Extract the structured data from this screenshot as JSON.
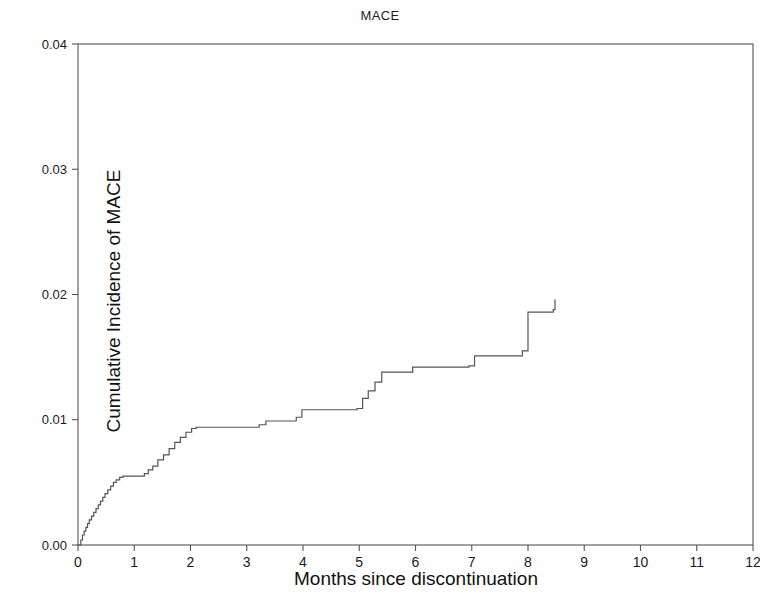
{
  "chart_data": {
    "type": "line",
    "subtype": "cumulative-incidence-step",
    "title": "MACE",
    "xlabel": "Months since discontinuation",
    "ylabel": "Cumulative Incidence of MACE",
    "xlim": [
      0,
      12
    ],
    "ylim": [
      0,
      0.04
    ],
    "xticks": [
      0,
      1,
      2,
      3,
      4,
      5,
      6,
      7,
      8,
      9,
      10,
      11,
      12
    ],
    "xticklabels": [
      "0",
      "1",
      "2",
      "3",
      "4",
      "5",
      "6",
      "7",
      "8",
      "9",
      "10",
      "11",
      "12"
    ],
    "yticks": [
      0.0,
      0.01,
      0.02,
      0.03,
      0.04
    ],
    "yticklabels": [
      "0.00",
      "0.01",
      "0.02",
      "0.03",
      "0.04"
    ],
    "grid": false,
    "legend": null,
    "line_color": "#555555",
    "frame_color": "#555555",
    "series": [
      {
        "name": "Cumulative incidence of MACE",
        "x": [
          0.0,
          0.05,
          0.08,
          0.11,
          0.14,
          0.17,
          0.2,
          0.24,
          0.28,
          0.32,
          0.36,
          0.4,
          0.44,
          0.48,
          0.53,
          0.58,
          0.63,
          0.68,
          0.74,
          0.8,
          1.18,
          1.25,
          1.33,
          1.42,
          1.52,
          1.62,
          1.72,
          1.82,
          1.92,
          2.02,
          2.1,
          3.22,
          3.34,
          3.88,
          3.98,
          4.96,
          5.06,
          5.16,
          5.28,
          5.4,
          5.95,
          6.95,
          7.05,
          7.9,
          8.0,
          8.45,
          8.48
        ],
        "y": [
          0.0,
          0.0004,
          0.0008,
          0.0011,
          0.0014,
          0.0017,
          0.002,
          0.0023,
          0.0026,
          0.0029,
          0.0032,
          0.0035,
          0.0038,
          0.0041,
          0.0044,
          0.0047,
          0.005,
          0.0052,
          0.0054,
          0.0055,
          0.0057,
          0.006,
          0.0063,
          0.0068,
          0.0072,
          0.0077,
          0.0082,
          0.0086,
          0.009,
          0.0093,
          0.0094,
          0.0096,
          0.0099,
          0.0102,
          0.0108,
          0.0109,
          0.0117,
          0.0123,
          0.013,
          0.0138,
          0.0142,
          0.0143,
          0.0151,
          0.0155,
          0.0186,
          0.0188,
          0.0196
        ]
      }
    ]
  },
  "layout": {
    "plot_left": 78,
    "plot_right": 753,
    "plot_top": 44,
    "plot_bottom": 545
  }
}
